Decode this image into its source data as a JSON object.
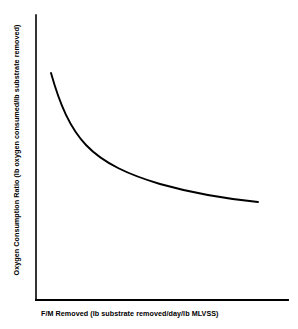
{
  "chart_data": {
    "type": "line",
    "title": "",
    "xlabel": "F/M Removed (lb substrate removed/day/lb MLVSS)",
    "ylabel": "Oxygen Consumption Ratio (lb oxygen consumed/lb substrate removed)",
    "grid": false,
    "legend": false,
    "xlim": [
      0,
      1
    ],
    "ylim": [
      0,
      1
    ],
    "xticks": [],
    "yticks": [],
    "axis_color": "#000000",
    "curve_color": "#000000",
    "background_color": "#ffffff",
    "series": [
      {
        "name": "Oxygen consumption ratio",
        "shape": "decaying-hyperbolic",
        "x": [
          0.06,
          0.09,
          0.12,
          0.16,
          0.21,
          0.27,
          0.34,
          0.41,
          0.49,
          0.58,
          0.67,
          0.76,
          0.85,
          0.88
        ],
        "y": [
          0.8,
          0.71,
          0.63,
          0.56,
          0.5,
          0.45,
          0.41,
          0.38,
          0.35,
          0.32,
          0.3,
          0.28,
          0.27,
          0.265
        ],
        "path": "M 51 73 C 60 105, 70 128, 86 145 C 104 164, 130 175, 160 184 C 192 193, 228 199, 258 202"
      }
    ]
  },
  "axes": {
    "y_axis_path": "M 36 15 L 36 300",
    "x_axis_path": "M 36 300 L 288 300",
    "y_axis_width": 1.6,
    "x_axis_width": 1.9
  }
}
